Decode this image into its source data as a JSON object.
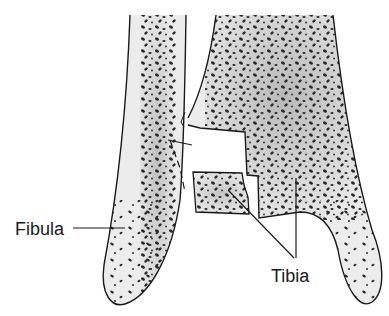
{
  "figure": {
    "type": "anatomical-illustration",
    "labels": {
      "fibula": "Fibula",
      "tibia": "Tibia"
    },
    "colors": {
      "background": "#ffffff",
      "bone_fill": "#e8e8e8",
      "bone_shade": "#b8b8b8",
      "outline": "#1a1a1a",
      "pores": "#2a2a2a"
    }
  }
}
